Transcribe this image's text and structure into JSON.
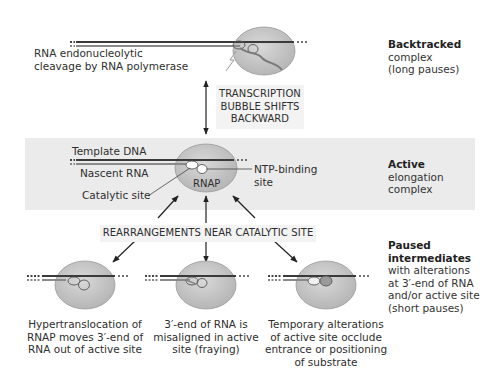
{
  "figure": {
    "backtracked": {
      "caption": [
        "RNA endonucleolytic",
        "cleavage by RNA polymerase"
      ],
      "side_title": "Backtracked",
      "side_lines": [
        "complex",
        "(long pauses)"
      ]
    },
    "transition_box": [
      "TRANSCRIPTION",
      "BUBBLE SHIFTS",
      "BACKWARD"
    ],
    "active": {
      "labels": {
        "template_dna": "Template DNA",
        "nascent_rna": "Nascent RNA",
        "catalytic_site": "Catalytic site",
        "rnap": "RNAP",
        "ntp_binding": [
          "NTP-binding",
          "site"
        ]
      },
      "side_title": "Active",
      "side_lines": [
        "elongation",
        "complex"
      ]
    },
    "rearrangements_box": "REARRANGEMENTS NEAR CATALYTIC SITE",
    "paused": {
      "side_title": [
        "Paused",
        "intermediates"
      ],
      "side_lines": [
        "with alterations",
        "at  3′-end of RNA",
        "and/or active site",
        "(short pauses)"
      ],
      "captions": [
        [
          "Hypertranslocation of",
          "RNAP moves 3′-end of",
          "RNA out of active site"
        ],
        [
          "3′-end of RNA is",
          "misaligned in active",
          "site (fraying)"
        ],
        [
          "Temporary alterations",
          "of active site occlude",
          "entrance or positioning",
          "of substrate"
        ]
      ]
    },
    "colors": {
      "polymerase_fill": "#c9c9c9",
      "dna_strand": "#3a3a3a",
      "rna_strand": "#8a8a8a",
      "band": "#ebebeb",
      "box": "#f3f3f3"
    }
  }
}
